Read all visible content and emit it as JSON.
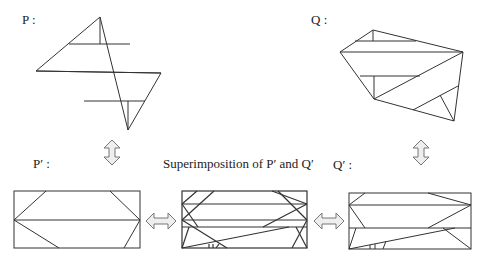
{
  "labels": {
    "p": "P :",
    "q": "Q :",
    "p_prime": "P′ :",
    "q_prime": "Q′ :",
    "superimposition": "Superimposition of P′  and Q′"
  },
  "colors": {
    "stroke": "#333333",
    "arrow_fill": "#eeeeee",
    "arrow_stroke": "#777777"
  },
  "figures": [
    {
      "id": "P",
      "kind": "polygon-dissection"
    },
    {
      "id": "Q",
      "kind": "polygon-dissection"
    },
    {
      "id": "P_prime",
      "kind": "rectangle-dissection"
    },
    {
      "id": "superimposition",
      "kind": "rectangle-overlay"
    },
    {
      "id": "Q_prime",
      "kind": "rectangle-dissection"
    }
  ]
}
